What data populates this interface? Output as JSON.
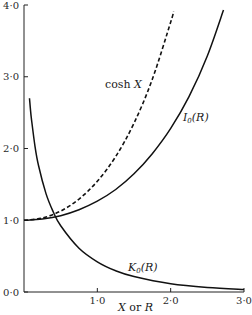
{
  "chart_data": {
    "type": "line",
    "title": "",
    "xlabel": "X or R",
    "ylabel": "",
    "xlim": [
      0,
      3.0
    ],
    "ylim": [
      0,
      4.0
    ],
    "grid": false,
    "x_ticks": [
      "1·0",
      "2·0",
      "3·0"
    ],
    "y_ticks": [
      "0·0",
      "1·0",
      "2·0",
      "3·0",
      "4·0"
    ],
    "series": [
      {
        "name": "cosh X",
        "style": "dashed",
        "x": [
          0,
          0.25,
          0.5,
          0.75,
          1.0,
          1.25,
          1.5,
          1.75,
          2.0,
          2.04
        ],
        "values": [
          1.0,
          1.031,
          1.128,
          1.295,
          1.543,
          1.888,
          2.352,
          2.964,
          3.762,
          3.91
        ]
      },
      {
        "name": "I0(R)",
        "style": "solid",
        "x": [
          0,
          0.25,
          0.5,
          0.75,
          1.0,
          1.25,
          1.5,
          1.75,
          2.0,
          2.25,
          2.5,
          2.72
        ],
        "values": [
          1.0,
          1.016,
          1.063,
          1.146,
          1.266,
          1.429,
          1.647,
          1.928,
          2.28,
          2.724,
          3.29,
          3.93
        ]
      },
      {
        "name": "K0(R)",
        "style": "solid",
        "x": [
          0.075,
          0.1,
          0.15,
          0.2,
          0.3,
          0.4,
          0.5,
          0.75,
          1.0,
          1.25,
          1.5,
          2.0,
          2.5,
          3.0
        ],
        "values": [
          2.7,
          2.427,
          2.03,
          1.753,
          1.372,
          1.115,
          0.924,
          0.611,
          0.421,
          0.296,
          0.214,
          0.114,
          0.062,
          0.035
        ]
      }
    ],
    "annotations": [
      {
        "text": "cosh X",
        "near_series": "cosh X"
      },
      {
        "text": "I0(R)",
        "near_series": "I0(R)"
      },
      {
        "text": "K0(R)",
        "near_series": "K0(R)"
      }
    ],
    "legend": "inline labels"
  },
  "labels": {
    "cosh": "cosh",
    "cosh_var": "X",
    "i0_main": "I",
    "i0_sub": "0",
    "i0_arg": "(R)",
    "k0_main": "K",
    "k0_sub": "0",
    "k0_arg": "(R)",
    "xlabel_x": "X",
    "xlabel_or": " or ",
    "xlabel_r": "R"
  }
}
